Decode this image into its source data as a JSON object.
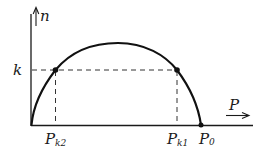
{
  "diagram": {
    "type": "curve-plot",
    "axes": {
      "y_label": "n",
      "x_label": "P"
    },
    "level": {
      "label": "k"
    },
    "points": [
      {
        "label_main": "P",
        "label_sub": "k2"
      },
      {
        "label_main": "P",
        "label_sub": "k1"
      },
      {
        "label_main": "P",
        "label_sub": "0"
      }
    ],
    "colors": {
      "stroke": "#1a1a1a",
      "background": "#ffffff"
    }
  }
}
